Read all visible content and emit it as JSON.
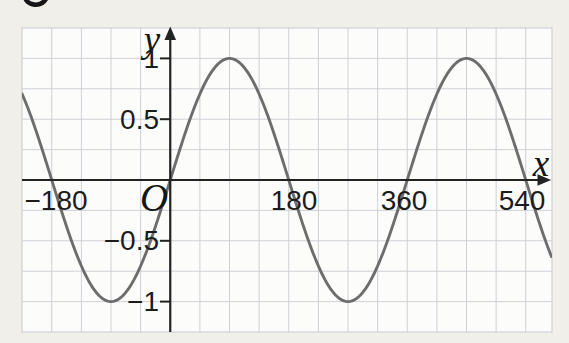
{
  "figure": {
    "corner_glyph": "partial-cropped-print-character"
  },
  "chart_data": {
    "type": "line",
    "x_unit": "degrees",
    "x_range": [
      -225,
      580
    ],
    "y_range": [
      -1.25,
      1.25
    ],
    "grid": {
      "visible": true,
      "x_step_deg": 45,
      "y_step": 0.25
    },
    "legend": "none",
    "series": [
      {
        "name": "y = sin x",
        "shape": "sine",
        "amplitude": 1,
        "period_deg": 360,
        "phase_deg": 0
      }
    ],
    "key_points": {
      "zeros_deg": [
        -180,
        0,
        180,
        360,
        540
      ],
      "maxima": [
        {
          "x": 90,
          "y": 1
        },
        {
          "x": 450,
          "y": 1
        }
      ],
      "minima": [
        {
          "x": -90,
          "y": -1
        },
        {
          "x": 270,
          "y": -1
        }
      ]
    },
    "axis_labels": {
      "x": "x",
      "y": "y",
      "origin": "O"
    },
    "x_ticks": [
      {
        "value": -180,
        "label": "−180"
      },
      {
        "value": 180,
        "label": "180"
      },
      {
        "value": 360,
        "label": "360"
      },
      {
        "value": 540,
        "label": "540"
      }
    ],
    "y_ticks": [
      {
        "value": 1,
        "label": "1"
      },
      {
        "value": 0.5,
        "label": "0.5"
      },
      {
        "value": -0.5,
        "label": "−0.5"
      },
      {
        "value": -1,
        "label": "−1"
      }
    ],
    "colors": {
      "curve": "#6d6d6d",
      "axis": "#232323",
      "grid": "#cdd0d5",
      "plot_bg": "#fcfcfb",
      "page_bg": "#f0efea",
      "text": "#1c1c1c"
    }
  }
}
